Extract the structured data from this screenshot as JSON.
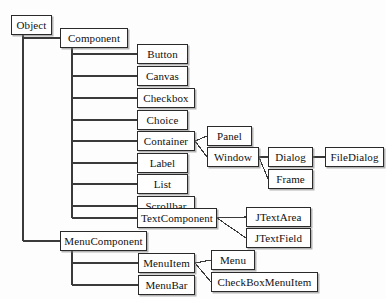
{
  "diagram": {
    "type": "tree-diagram",
    "background_color": "#fdfdfd",
    "box_border_color": "#2a2a2a",
    "box_fill_color": "#ffffff",
    "line_color": "#3a3a3a",
    "nodes": [
      {
        "id": "object",
        "label": "Object",
        "x": 11,
        "y": 15,
        "w": 41,
        "h": 20
      },
      {
        "id": "component",
        "label": "Component",
        "x": 60,
        "y": 28,
        "w": 68,
        "h": 20
      },
      {
        "id": "button",
        "label": "Button",
        "x": 137,
        "y": 44,
        "w": 51,
        "h": 20
      },
      {
        "id": "canvas",
        "label": "Canvas",
        "x": 137,
        "y": 66,
        "w": 51,
        "h": 20
      },
      {
        "id": "checkbox",
        "label": "Checkbox",
        "x": 137,
        "y": 88,
        "w": 58,
        "h": 20
      },
      {
        "id": "choice",
        "label": "Choice",
        "x": 137,
        "y": 110,
        "w": 51,
        "h": 20
      },
      {
        "id": "container",
        "label": "Container",
        "x": 137,
        "y": 131,
        "w": 58,
        "h": 20
      },
      {
        "id": "label",
        "label": "Label",
        "x": 137,
        "y": 153,
        "w": 51,
        "h": 20
      },
      {
        "id": "list",
        "label": "List",
        "x": 137,
        "y": 174,
        "w": 51,
        "h": 20
      },
      {
        "id": "scrollbar",
        "label": "Scrollbar",
        "x": 137,
        "y": 196,
        "w": 58,
        "h": 20
      },
      {
        "id": "textcomponent",
        "label": "TextComponent",
        "x": 137,
        "y": 208,
        "w": 80,
        "h": 20
      },
      {
        "id": "menucomponent",
        "label": "MenuComponent",
        "x": 60,
        "y": 231,
        "w": 87,
        "h": 20
      },
      {
        "id": "menuitem",
        "label": "MenuItem",
        "x": 138,
        "y": 253,
        "w": 57,
        "h": 20
      },
      {
        "id": "menubar",
        "label": "MenuBar",
        "x": 138,
        "y": 275,
        "w": 57,
        "h": 20
      },
      {
        "id": "panel",
        "label": "Panel",
        "x": 207,
        "y": 126,
        "w": 45,
        "h": 20
      },
      {
        "id": "window",
        "label": "Window",
        "x": 207,
        "y": 147,
        "w": 52,
        "h": 20
      },
      {
        "id": "dialog",
        "label": "Dialog",
        "x": 268,
        "y": 147,
        "w": 45,
        "h": 20
      },
      {
        "id": "frame",
        "label": "Frame",
        "x": 268,
        "y": 169,
        "w": 45,
        "h": 20
      },
      {
        "id": "filedialog",
        "label": "FileDialog",
        "x": 325,
        "y": 147,
        "w": 59,
        "h": 20
      },
      {
        "id": "jtextarea",
        "label": "JTextArea",
        "x": 246,
        "y": 207,
        "w": 65,
        "h": 20
      },
      {
        "id": "jtextfield",
        "label": "JTextField",
        "x": 246,
        "y": 228,
        "w": 65,
        "h": 20
      },
      {
        "id": "menu",
        "label": "Menu",
        "x": 211,
        "y": 250,
        "w": 44,
        "h": 20
      },
      {
        "id": "checkboxmenuitem",
        "label": "CheckBoxMenuItem",
        "x": 211,
        "y": 272,
        "w": 107,
        "h": 20
      }
    ],
    "edges": [
      {
        "from": "object",
        "to": "component",
        "style": "elbow"
      },
      {
        "from": "object",
        "to": "menucomponent",
        "style": "elbow"
      },
      {
        "from": "component",
        "to": "button",
        "style": "elbow"
      },
      {
        "from": "component",
        "to": "canvas",
        "style": "elbow"
      },
      {
        "from": "component",
        "to": "checkbox",
        "style": "elbow"
      },
      {
        "from": "component",
        "to": "choice",
        "style": "elbow"
      },
      {
        "from": "component",
        "to": "container",
        "style": "elbow"
      },
      {
        "from": "component",
        "to": "label",
        "style": "elbow"
      },
      {
        "from": "component",
        "to": "list",
        "style": "elbow"
      },
      {
        "from": "component",
        "to": "scrollbar",
        "style": "elbow"
      },
      {
        "from": "component",
        "to": "textcomponent",
        "style": "elbow"
      },
      {
        "from": "container",
        "to": "panel",
        "style": "straight"
      },
      {
        "from": "container",
        "to": "window",
        "style": "diagonal"
      },
      {
        "from": "window",
        "to": "dialog",
        "style": "straight"
      },
      {
        "from": "window",
        "to": "frame",
        "style": "diagonal"
      },
      {
        "from": "dialog",
        "to": "filedialog",
        "style": "straight"
      },
      {
        "from": "textcomponent",
        "to": "jtextarea",
        "style": "straight"
      },
      {
        "from": "textcomponent",
        "to": "jtextfield",
        "style": "diagonal"
      },
      {
        "from": "menucomponent",
        "to": "menuitem",
        "style": "elbow"
      },
      {
        "from": "menucomponent",
        "to": "menubar",
        "style": "elbow"
      },
      {
        "from": "menuitem",
        "to": "menu",
        "style": "straight"
      },
      {
        "from": "menuitem",
        "to": "checkboxmenuitem",
        "style": "diagonal"
      }
    ]
  }
}
